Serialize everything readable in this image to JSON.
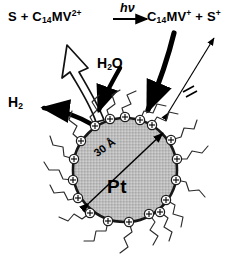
{
  "figure": {
    "type": "scientific-schematic"
  },
  "equation": {
    "reactant_sensitizer": "S",
    "plus_1": "+",
    "reactant_relay": "C",
    "reactant_relay_sub": "14",
    "reactant_relay_rest": "MV",
    "reactant_relay_charge": "2+",
    "condition": "hν",
    "product_relay": "C",
    "product_relay_sub": "14",
    "product_relay_rest": "MV",
    "product_relay_charge": "+",
    "plus_2": "+",
    "product_sensitizer": "S",
    "product_sensitizer_charge": "+",
    "full_text": "S + C14MV2+ --hv--> C14MV+ + S+"
  },
  "labels": {
    "water": "H",
    "water_sub": "2",
    "water_rest": "O",
    "water_full": "H2O",
    "hydrogen": "H",
    "hydrogen_sub": "2",
    "hydrogen_full": "H2",
    "particle": "Pt",
    "diameter": "30 Å"
  },
  "icons": {
    "hollow_arrow": "hollow-curved-arrow-icon",
    "black_arrow_h2": "black-arrow-left-icon",
    "black_arrow_h2o": "black-curved-arrow-icon",
    "black_arrow_relay": "black-curved-arrow-icon",
    "blocked_arrow": "blocked-double-arrow-icon",
    "diameter_arrow": "double-headed-arrow-icon",
    "charge_marker": "circled-plus-icon",
    "surfactant_chain": "zigzag-chain-icon"
  },
  "colors": {
    "ink": "#000000",
    "particle_fill": "#b9b9b9",
    "particle_stroke": "#1a1a1a",
    "background": "#ffffff",
    "chain_stroke": "#2b2b2b"
  },
  "particle": {
    "center_x": 125,
    "center_y": 170,
    "radius": 52,
    "charge_count": 18
  }
}
